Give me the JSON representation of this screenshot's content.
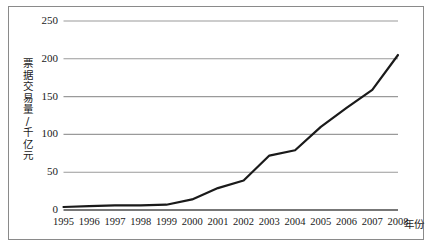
{
  "figure": {
    "background_color": "#ffffff",
    "border_color": "#8a8a8a"
  },
  "axis": {
    "y_title": "票据交易量/千亿元",
    "y_title_chars": [
      "票",
      "据",
      "交",
      "易",
      "量",
      "/",
      "千",
      "亿",
      "元"
    ],
    "x_title": "年份",
    "y_ticks": [
      "0",
      "50",
      "100",
      "150",
      "200",
      "250"
    ],
    "x_ticks": [
      "1995",
      "1996",
      "1997",
      "1998",
      "1999",
      "2000",
      "2001",
      "2002",
      "2003",
      "2004",
      "2005",
      "2006",
      "2007",
      "2008"
    ]
  },
  "chart_data": {
    "type": "line",
    "title": "",
    "xlabel": "年份",
    "ylabel": "票据交易量/千亿元",
    "categories": [
      "1995",
      "1996",
      "1997",
      "1998",
      "1999",
      "2000",
      "2001",
      "2002",
      "2003",
      "2004",
      "2005",
      "2006",
      "2007",
      "2008"
    ],
    "x": [
      1995,
      1996,
      1997,
      1998,
      1999,
      2000,
      2001,
      2002,
      2003,
      2004,
      2005,
      2006,
      2007,
      2008
    ],
    "values": [
      4,
      5,
      6,
      6,
      7,
      14,
      29,
      39,
      72,
      79,
      110,
      135,
      159,
      205
    ],
    "series": [
      {
        "name": "票据交易量",
        "values": [
          4,
          5,
          6,
          6,
          7,
          14,
          29,
          39,
          72,
          79,
          110,
          135,
          159,
          205
        ],
        "color": "#1a1a1a",
        "line_width": 2.2,
        "markers": false
      }
    ],
    "ylim": [
      0,
      250
    ],
    "ytick_values": [
      0,
      50,
      100,
      150,
      200,
      250
    ],
    "grid": {
      "horizontal": true,
      "vertical": false,
      "color": "#9a9a9a"
    },
    "legend": {
      "visible": false,
      "position": "none"
    },
    "axis_line_color": "#4a4a4a"
  }
}
